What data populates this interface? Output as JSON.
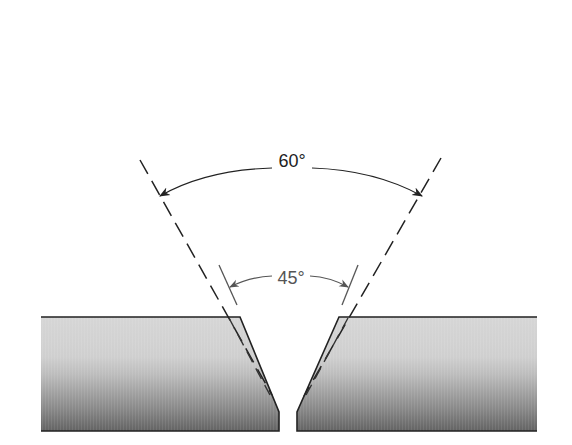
{
  "diagram": {
    "type": "weld-joint-bevel",
    "labels": {
      "outer_angle": "60°",
      "inner_angle": "45°"
    },
    "colors": {
      "plate_top": "#d4d4d4",
      "plate_mid": "#c2c2c2",
      "plate_bottom": "#6a6a6a",
      "outline": "#222222",
      "dashed_line": "#222222",
      "inner_line": "#666666"
    }
  }
}
